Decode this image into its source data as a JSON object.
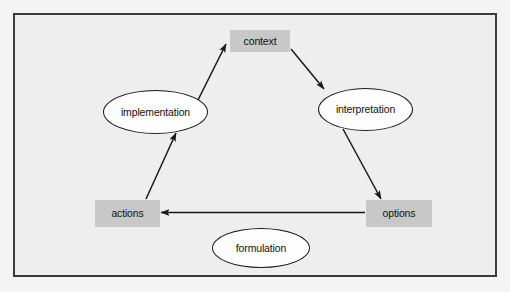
{
  "diagram": {
    "title": "",
    "background_color": "#eeeeee",
    "frame_border_color": "#3b3b3b",
    "box_fill_color": "#c8c8c8",
    "ellipse_fill_color": "#fdfdfd",
    "stroke_color": "#1a1a1a",
    "text_color": "#121212",
    "nodes": [
      {
        "id": "context",
        "label": "context",
        "shape": "rectangle",
        "x": 230,
        "y": 30,
        "width": 60,
        "height": 22
      },
      {
        "id": "implementation",
        "label": "implementation",
        "shape": "ellipse",
        "x": 103,
        "y": 90,
        "width": 105,
        "height": 44
      },
      {
        "id": "interpretation",
        "label": "interpretation",
        "shape": "ellipse",
        "x": 318,
        "y": 88,
        "width": 95,
        "height": 43
      },
      {
        "id": "actions",
        "label": "actions",
        "shape": "rectangle",
        "x": 95,
        "y": 200,
        "width": 65,
        "height": 27
      },
      {
        "id": "options",
        "label": "options",
        "shape": "rectangle",
        "x": 366,
        "y": 200,
        "width": 66,
        "height": 27
      },
      {
        "id": "formulation",
        "label": "formulation",
        "shape": "ellipse",
        "x": 212,
        "y": 228,
        "width": 98,
        "height": 40
      }
    ],
    "edges": [
      {
        "id": "implementation-to-context",
        "from": "implementation",
        "to": "context",
        "directed": true
      },
      {
        "id": "context-to-interpretation",
        "from": "context",
        "to": "interpretation",
        "directed": true
      },
      {
        "id": "interpretation-to-options",
        "from": "interpretation",
        "to": "options",
        "directed": true
      },
      {
        "id": "options-to-actions",
        "from": "options",
        "to": "actions",
        "directed": true
      },
      {
        "id": "actions-to-implementation",
        "from": "actions",
        "to": "implementation",
        "directed": true
      }
    ]
  }
}
